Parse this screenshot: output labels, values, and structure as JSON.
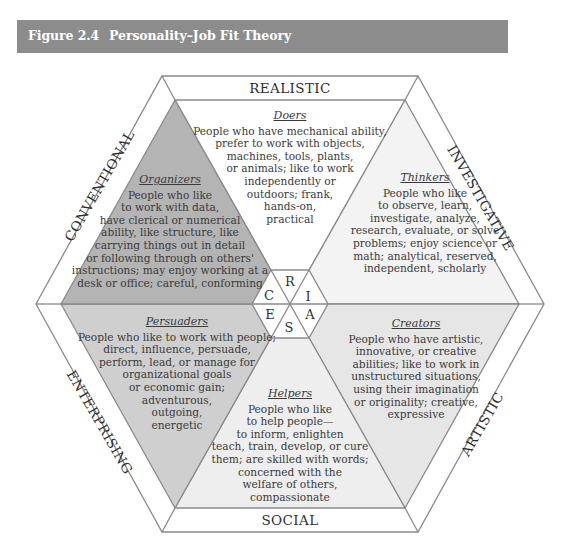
{
  "header": {
    "figure_number": "Figure 2.4",
    "title": "Personality–Job Fit Theory",
    "background_color": "#8c8c8c"
  },
  "dimensions": {
    "realistic": "REALISTIC",
    "investigative": "INVESTIGATIVE",
    "artistic": "ARTISTIC",
    "social": "SOCIAL",
    "enterprising": "ENTERPRISING",
    "conventional": "CONVENTIONAL"
  },
  "center_letters": {
    "r": "R",
    "i": "I",
    "a": "A",
    "s": "S",
    "e": "E",
    "c": "C"
  },
  "types": {
    "doers": {
      "title": "Doers",
      "lines": [
        "People who have mechanical ability,",
        "prefer to work with objects,",
        "machines, tools, plants,",
        "or animals; like to work",
        "independently or",
        "outdoors; frank,",
        "hands-on,",
        "practical"
      ],
      "fill": "#ffffff"
    },
    "thinkers": {
      "title": "Thinkers",
      "lines": [
        "People who like",
        "to observe, learn,",
        "investigate, analyze,",
        "research, evaluate, or solve",
        "problems; enjoy science or",
        "math; analytical, reserved,",
        "independent, scholarly"
      ],
      "fill": "#f3f3f3"
    },
    "creators": {
      "title": "Creators",
      "lines": [
        "People who have artistic,",
        "innovative, or creative",
        "abilities; like to work in",
        "unstructured situations,",
        "using their imagination",
        "or originality; creative,",
        "expressive"
      ],
      "fill": "#e6e6e6"
    },
    "helpers": {
      "title": "Helpers",
      "lines": [
        "People who like",
        "to help people—",
        "to inform, enlighten",
        "teach, train, develop, or cure",
        "them; are skilled with words;",
        "concerned with the",
        "welfare of others,",
        "compassionate"
      ],
      "fill": "#eeeeee"
    },
    "persuaders": {
      "title": "Persuaders",
      "lines": [
        "People who like to work with people;",
        "direct, influence, persuade,",
        "perform, lead, or manage for",
        "organizational goals",
        "or economic gain;",
        "adventurous,",
        "outgoing,",
        "energetic"
      ],
      "fill": "#cfcfcf"
    },
    "organizers": {
      "title": "Organizers",
      "lines": [
        "People who like",
        "to work with data,",
        "have clerical or numerical",
        "ability, like structure, like",
        "carrying things out in detail",
        "or following through on others'",
        "instructions; may enjoy working at a",
        "desk or office; careful, conforming"
      ],
      "fill": "#b4b4b4"
    }
  },
  "colors": {
    "outline": "#8a8a8a",
    "band": "#ffffff"
  }
}
